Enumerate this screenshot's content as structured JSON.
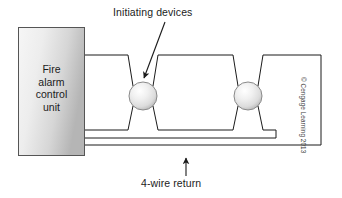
{
  "figure": {
    "background_color": "#ffffff",
    "width": 342,
    "height": 198
  },
  "panel": {
    "name": "fire-alarm-control-unit",
    "lines": [
      "Fire",
      "alarm",
      "control",
      "unit"
    ],
    "fill_start": "#f4f4f4",
    "fill_end": "#b9b9b9",
    "stroke": "#555555"
  },
  "labels": {
    "initiating_devices": "Initiating devices",
    "four_wire_return": "4-wire return"
  },
  "devices": [
    {
      "name": "initiating-device-1",
      "cx": 143,
      "cy": 96,
      "r": 14
    },
    {
      "name": "initiating-device-2",
      "cx": 248,
      "cy": 96,
      "r": 14
    }
  ],
  "device_style": {
    "fill_highlight": "#ffffff",
    "fill_mid": "#e8e8e8",
    "fill_edge": "#b0b0b0",
    "stroke": "#8a8a8a"
  },
  "wiring": {
    "stroke": "#1b1b1b",
    "stroke_width": 1,
    "description": "Two-conductor loop out to devices and back, plus 4-wire return conductors beneath"
  },
  "copyright": "© Cengage Learning 2013"
}
